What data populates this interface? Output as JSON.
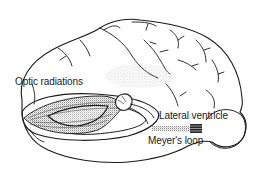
{
  "figure": {
    "labels": {
      "optic_radiations": "Optic radiations",
      "lateral_ventricle": "Lateral ventricle",
      "meyers_loop": "Meyer's loop"
    },
    "colors": {
      "ink": "#1a1a1a",
      "stipple": "#9a9a9a",
      "background": "#ffffff"
    }
  }
}
